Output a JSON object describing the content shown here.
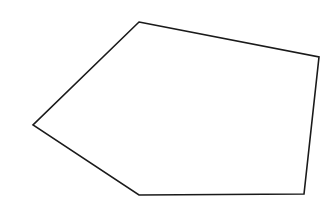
{
  "diagram": {
    "shape": "pentagon",
    "stroke_color": "#1a1a1a",
    "fill_color": "#ffffff",
    "stroke_width": 1.6,
    "vertices": [
      {
        "x": 139,
        "y": 22
      },
      {
        "x": 319,
        "y": 57
      },
      {
        "x": 304,
        "y": 194
      },
      {
        "x": 139,
        "y": 195
      },
      {
        "x": 33,
        "y": 125
      }
    ]
  }
}
